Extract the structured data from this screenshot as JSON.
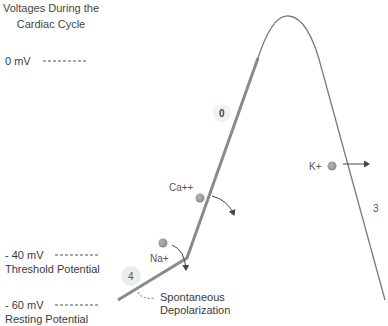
{
  "title": {
    "line1": "Voltages During the",
    "line2": "Cardiac Cycle"
  },
  "levels": [
    {
      "label": "0 mV",
      "sublabel": ""
    },
    {
      "label": "- 40 mV",
      "sublabel": "Threshold Potential"
    },
    {
      "label": "- 60 mV",
      "sublabel": "Resting Potential"
    }
  ],
  "phases": [
    {
      "id": "4",
      "label": "4"
    },
    {
      "id": "0",
      "label": "0"
    },
    {
      "id": "3",
      "label": "3"
    }
  ],
  "ions": [
    {
      "name": "Na+",
      "direction": "inward"
    },
    {
      "name": "Ca++",
      "direction": "inward"
    },
    {
      "name": "K+",
      "direction": "outward"
    }
  ],
  "annotation": {
    "line1": "Spontaneous",
    "line2": "Depolarization"
  },
  "colors": {
    "curve": "#8a8a8a",
    "ion_dot": "#999999",
    "phase_badge": "#ececec",
    "arrow": "#444444"
  }
}
